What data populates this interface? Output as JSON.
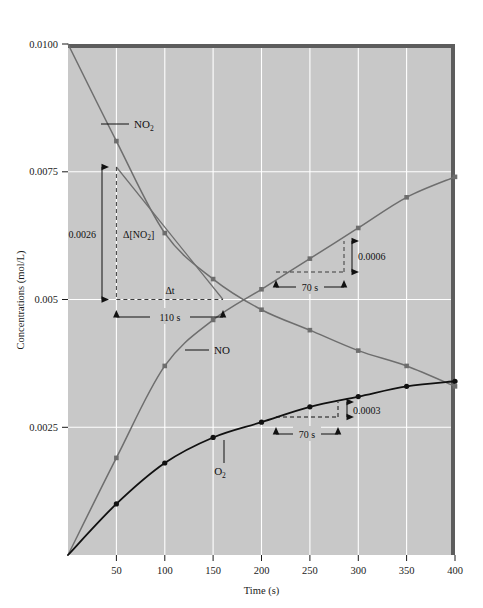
{
  "figure": {
    "background_color": "#ffffff",
    "plot_background_color": "#c8c8c8",
    "gridline_color": "#ffffff"
  },
  "axes": {
    "x_title": "Time (s)",
    "y_title": "Concentrations (mol/L)",
    "x_ticks": [
      "50",
      "100",
      "150",
      "200",
      "250",
      "300",
      "350",
      "400"
    ],
    "y_ticks": [
      "0.0025",
      "0.005",
      "0.0075",
      "0.0100"
    ]
  },
  "series_labels": {
    "no2": "NO",
    "no2_sub": "2",
    "no": "NO",
    "o2": "O",
    "o2_sub": "2"
  },
  "annotations": {
    "delta_no2_text": "Δ[NO",
    "delta_no2_sub": "2",
    "delta_no2_close": "]",
    "delta_no2_value": "0.0026",
    "delta_t": "Δt",
    "delta_t_value": "110 s",
    "no_rise": "0.0006",
    "no_run": "70 s",
    "o2_rise": "0.0003",
    "o2_run": "70 s"
  },
  "chart_data": {
    "type": "line",
    "title": "",
    "xlabel": "Time (s)",
    "ylabel": "Concentrations (mol/L)",
    "xlim": [
      0,
      400
    ],
    "ylim": [
      0,
      0.01
    ],
    "grid": true,
    "legend": "inline labels on curves",
    "x": [
      0,
      50,
      100,
      150,
      200,
      250,
      300,
      350,
      400
    ],
    "series": [
      {
        "name": "NO2",
        "color": "#6e6e6e",
        "marker": "square",
        "values": [
          0.01,
          0.0081,
          0.0063,
          0.0054,
          0.0048,
          0.0044,
          0.004,
          0.0037,
          0.0033
        ]
      },
      {
        "name": "NO",
        "color": "#6e6e6e",
        "marker": "square",
        "values": [
          0.0,
          0.0019,
          0.0037,
          0.0046,
          0.0052,
          0.0058,
          0.0064,
          0.007,
          0.0074
        ]
      },
      {
        "name": "O2",
        "color": "#111111",
        "marker": "circle",
        "values": [
          0.0,
          0.001,
          0.0018,
          0.0023,
          0.0026,
          0.0029,
          0.0031,
          0.0033,
          0.0034
        ]
      }
    ],
    "constructions": [
      {
        "name": "NO2 initial rate triangle",
        "label": "Δ[NO2]",
        "rise": -0.0026,
        "rise_label": "0.0026",
        "run": 110,
        "run_label": "110 s",
        "run_symbol": "Δt",
        "x_from": 50,
        "x_to": 160,
        "y_from": 0.0076,
        "y_to": 0.005
      },
      {
        "name": "NO instantaneous rate triangle",
        "rise": 0.0006,
        "rise_label": "0.0006",
        "run": 70,
        "run_label": "70 s",
        "x_from": 215,
        "x_to": 285,
        "y_from": 0.0054,
        "y_to": 0.006
      },
      {
        "name": "O2 instantaneous rate triangle",
        "rise": 0.0003,
        "rise_label": "0.0003",
        "run": 70,
        "run_label": "70 s",
        "x_from": 215,
        "x_to": 285,
        "y_from": 0.00265,
        "y_to": 0.00295
      }
    ]
  }
}
